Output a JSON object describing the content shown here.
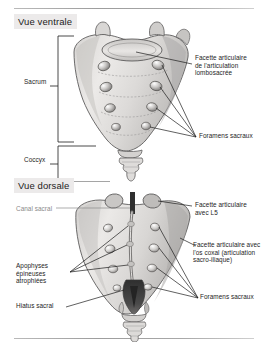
{
  "figure": {
    "type": "anatomical-illustration",
    "language": "fr",
    "panel_count": 2
  },
  "colors": {
    "bone_light": "#e6e4e2",
    "bone_mid": "#cfcdcb",
    "bone_shadow": "#a9a7a6",
    "outline": "#5d5c5c",
    "leader_line": "#1d1d1d",
    "label_text": "#1d1d1d",
    "label_gray": "#8a8a8a",
    "title_bg": "#eceaea",
    "rule": "#a8a8a8",
    "page_bg": "#ffffff",
    "hiatus_dark": "#3a3a3a"
  },
  "ventral": {
    "title": "Vue ventrale",
    "brackets": [
      {
        "name": "sacrum",
        "label": "Sacrum"
      },
      {
        "name": "coccyx",
        "label": "Coccyx"
      }
    ],
    "labels": [
      {
        "name": "facette-lombosacree",
        "text": "Facette articulaire\nde l'articulation\nlombosacrée",
        "side": "right"
      },
      {
        "name": "foramens-sacraux-ventral",
        "text": "Foramens sacraux",
        "side": "right"
      }
    ],
    "foramina_pairs": 4
  },
  "dorsal": {
    "title": "Vue dorsale",
    "labels": [
      {
        "name": "canal-sacral",
        "text": "Canal sacral",
        "side": "left",
        "style": "gray"
      },
      {
        "name": "facette-l5",
        "text": "Facette articulaire\navec L5",
        "side": "right"
      },
      {
        "name": "facette-os-coxal",
        "text": "Facette articulaire avec\nl'os coxal (articulation\nsacro-iliaque)",
        "side": "right"
      },
      {
        "name": "apophyses-epineuses",
        "text": "Apophyses\népineuses\natrophiées",
        "side": "left"
      },
      {
        "name": "hiatus-sacral",
        "text": "Hiatus sacral",
        "side": "left"
      },
      {
        "name": "foramens-sacraux-dorsal",
        "text": "Foramens sacraux",
        "side": "right"
      }
    ],
    "foramina_pairs": 4
  }
}
